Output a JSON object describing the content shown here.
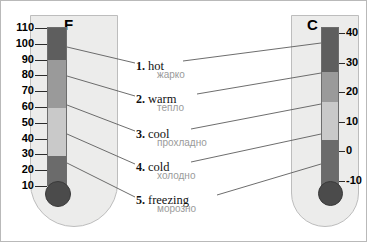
{
  "background": "#ffffff",
  "border_color": "#b9b9b9",
  "thermometers": [
    {
      "id": "fahrenheit",
      "letter": "F",
      "unit": "Fahrenheit",
      "ticks": [
        "110",
        "100",
        "90",
        "80",
        "70",
        "60",
        "50",
        "40",
        "30",
        "20",
        "10"
      ],
      "tick_side": "left",
      "column_colors": [
        "#5e5e5e",
        "#9a9a9a",
        "#c9c9c9",
        "#6b6b6b"
      ],
      "bulb_color": "#4b4b4b"
    },
    {
      "id": "celsius",
      "letter": "C",
      "unit": "Celsius",
      "ticks": [
        "40",
        "30",
        "20",
        "10",
        "0",
        "-10"
      ],
      "tick_side": "right",
      "column_colors": [
        "#5e5e5e",
        "#9a9a9a",
        "#c9c9c9",
        "#6b6b6b"
      ],
      "bulb_color": "#4b4b4b"
    }
  ],
  "captions": [
    {
      "number": "1.",
      "english": "hot",
      "russian": "жарко"
    },
    {
      "number": "2.",
      "english": "warm",
      "russian": "тепло"
    },
    {
      "number": "3.",
      "english": "cool",
      "russian": "прохладно"
    },
    {
      "number": "4.",
      "english": "cold",
      "russian": "холодно"
    },
    {
      "number": "5.",
      "english": "freezing",
      "russian": "морозно"
    }
  ],
  "chart_data": {
    "type": "table",
    "xlabel": "",
    "ylabel": "Temperature",
    "grid": false,
    "legend": "none",
    "axes": [
      {
        "name": "F",
        "unit": "Fahrenheit",
        "ticks": [
          110,
          100,
          90,
          80,
          70,
          60,
          50,
          40,
          30,
          20,
          10
        ],
        "range": [
          10,
          110
        ]
      },
      {
        "name": "C",
        "unit": "Celsius",
        "ticks": [
          40,
          30,
          20,
          10,
          0,
          -10
        ],
        "range": [
          -10,
          45
        ]
      }
    ],
    "categories": [
      "hot",
      "warm",
      "cool",
      "cold",
      "freezing"
    ],
    "series": [
      {
        "name": "Fahrenheit (°F)",
        "values": [
          100,
          80,
          60,
          40,
          20
        ]
      },
      {
        "name": "Celsius (°C)",
        "values": [
          38,
          27,
          16,
          4,
          -7
        ]
      }
    ],
    "annotations": [
      "1. hot / жарко",
      "2. warm / тепло",
      "3. cool / прохладно",
      "4. cold / холодно",
      "5. freezing / морозно"
    ]
  }
}
